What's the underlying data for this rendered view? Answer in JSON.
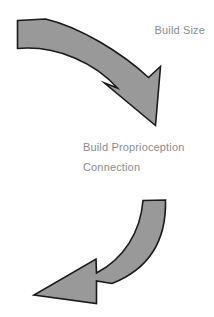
{
  "diagram": {
    "type": "cycle-arrows",
    "background_color": "#ffffff",
    "arrow_fill_color": "#999999",
    "arrow_stroke_color": "#1a1a1a",
    "text_color": "#8d8d8d",
    "labels": {
      "top_right": "Build Size",
      "center_line_1": "Build Proprioception",
      "center_line_2": "Connection"
    },
    "arrows": [
      {
        "name": "top-arrow",
        "direction": "clockwise-down-right",
        "description": "curved arrow sweeping from upper-left down to lower-right"
      },
      {
        "name": "bottom-arrow",
        "direction": "counterclockwise-down-left",
        "description": "curved arrow sweeping from upper-right down to lower-left"
      }
    ]
  }
}
